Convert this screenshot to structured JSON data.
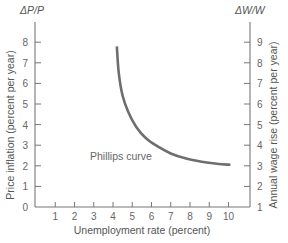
{
  "chart_data": {
    "type": "line",
    "title": "",
    "xlabel": "Unemployment rate (percent)",
    "ylabel": "Price inflation (percent per year)",
    "ylabel_right": "Annual wage rise (percent per year)",
    "y_symbol": "ΔP/P",
    "y_right_symbol": "ΔW/W",
    "xlim": [
      0,
      11
    ],
    "ylim": [
      0,
      8.5
    ],
    "ylim_right": [
      1,
      9.5
    ],
    "x_ticks": [
      1,
      2,
      3,
      4,
      5,
      6,
      7,
      8,
      9,
      10
    ],
    "y_ticks": [
      0,
      1,
      2,
      3,
      4,
      5,
      6,
      7,
      8
    ],
    "y_right_ticks": [
      1,
      2,
      3,
      4,
      5,
      6,
      7,
      8,
      9
    ],
    "grid": false,
    "annotations": [
      {
        "text": "Phillips curve",
        "x": 4.1,
        "y": 2.4
      }
    ],
    "series": [
      {
        "name": "Phillips curve",
        "x": [
          4.2,
          4.3,
          4.5,
          4.8,
          5.2,
          5.7,
          6.3,
          7.0,
          7.8,
          8.6,
          9.4,
          10.1
        ],
        "values": [
          7.8,
          6.5,
          5.4,
          4.6,
          3.9,
          3.35,
          2.95,
          2.6,
          2.35,
          2.2,
          2.1,
          2.05
        ]
      }
    ]
  },
  "labels": {
    "x_axis_title": "Unemployment rate (percent)",
    "y_axis_title": "Price inflation (percent per year)",
    "y_right_axis_title": "Annual wage rise (percent per year)",
    "y_symbol": "ΔP/P",
    "y_right_symbol": "ΔW/W",
    "curve_label": "Phillips curve"
  }
}
